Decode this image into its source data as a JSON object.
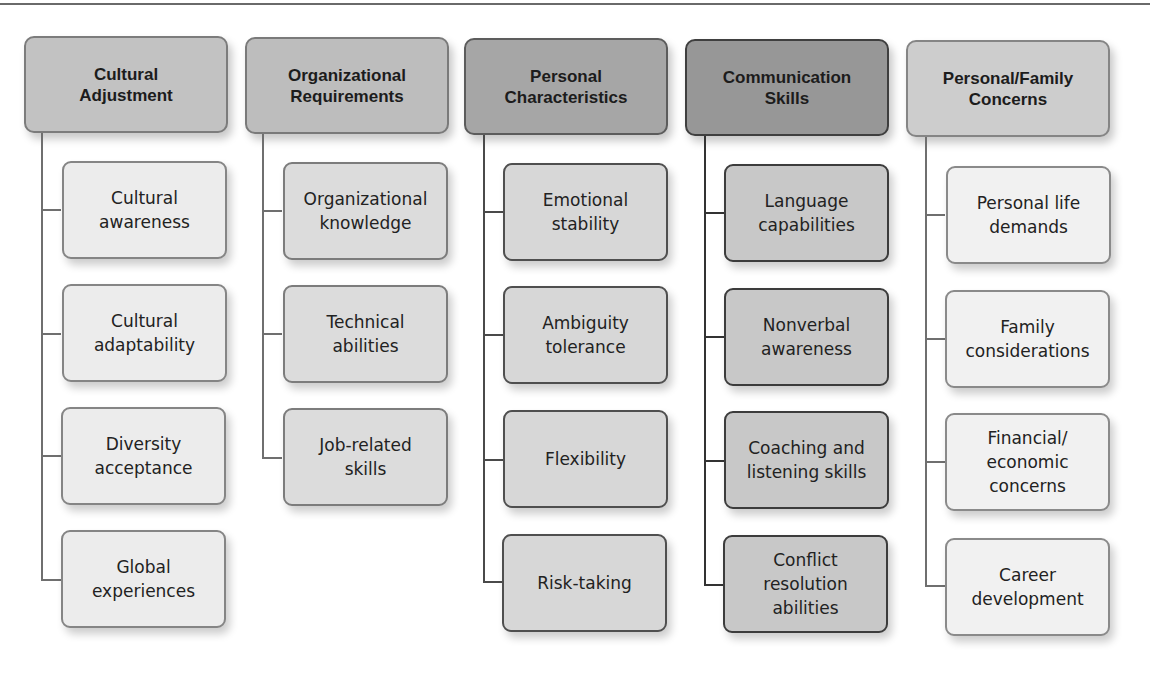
{
  "diagram": {
    "type": "hierarchy",
    "columns": [
      {
        "title": "Cultural\nAdjustment",
        "items": [
          "Cultural\nawareness",
          "Cultural\nadaptability",
          "Diversity\nacceptance",
          "Global\nexperiences"
        ]
      },
      {
        "title": "Organizational\nRequirements",
        "items": [
          "Organizational\nknowledge",
          "Technical\nabilities",
          "Job-related\nskills"
        ]
      },
      {
        "title": "Personal\nCharacteristics",
        "items": [
          "Emotional\nstability",
          "Ambiguity\ntolerance",
          "Flexibility",
          "Risk-taking"
        ]
      },
      {
        "title": "Communication\nSkills",
        "items": [
          "Language\ncapabilities",
          "Nonverbal\nawareness",
          "Coaching and\nlistening skills",
          "Conflict\nresolution\nabilities"
        ]
      },
      {
        "title": "Personal/Family\nConcerns",
        "items": [
          "Personal life\ndemands",
          "Family\nconsiderations",
          "Financial/\neconomic\nconcerns",
          "Career\ndevelopment"
        ]
      }
    ],
    "colors": {
      "header_shades": [
        "#c2c2c2",
        "#bdbdbd",
        "#a6a6a6",
        "#979797",
        "#cdcdcd"
      ],
      "child_shades": [
        "#ececec",
        "#dcdcdc",
        "#d7d7d7",
        "#c8c8c8",
        "#f1f1f1"
      ],
      "connector": "#6f6f6f"
    }
  }
}
